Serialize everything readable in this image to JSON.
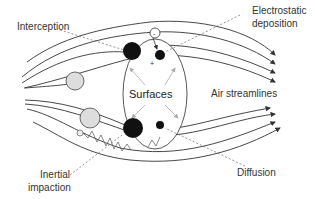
{
  "diagram": {
    "labels": {
      "interception": "Interception",
      "electrostatic_line1": "Electrostatic",
      "electrostatic_line2": "deposition",
      "surfaces": "Surfaces",
      "air_streamlines": "Air streamlines",
      "inertial_line1": "Inertial",
      "inertial_line2": "impaction",
      "diffusion": "Diffusion"
    },
    "colors": {
      "line": "#333333",
      "particle_dark": "#111111",
      "particle_light": "#dddddd",
      "leader": "#666666",
      "arrow_light": "#aaaaaa"
    }
  }
}
